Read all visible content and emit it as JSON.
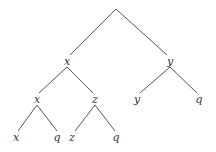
{
  "diagram": {
    "type": "tree",
    "nodes": [
      {
        "id": "root",
        "label": "",
        "x": 116,
        "y": 9
      },
      {
        "id": "n1",
        "label": "x",
        "x": 67,
        "y": 62
      },
      {
        "id": "n2",
        "label": "y",
        "x": 170,
        "y": 62
      },
      {
        "id": "n3",
        "label": "x",
        "x": 37,
        "y": 100
      },
      {
        "id": "n4",
        "label": "z",
        "x": 95,
        "y": 100
      },
      {
        "id": "n5",
        "label": "y",
        "x": 137,
        "y": 100
      },
      {
        "id": "n6",
        "label": "q",
        "x": 199,
        "y": 100
      },
      {
        "id": "n7",
        "label": "x",
        "x": 16,
        "y": 138
      },
      {
        "id": "n8",
        "label": "q",
        "x": 57,
        "y": 138
      },
      {
        "id": "n9",
        "label": "z",
        "x": 72,
        "y": 138
      },
      {
        "id": "n10",
        "label": "q",
        "x": 116,
        "y": 138
      }
    ],
    "edges": [
      [
        "root",
        "n1"
      ],
      [
        "root",
        "n2"
      ],
      [
        "n1",
        "n3"
      ],
      [
        "n1",
        "n4"
      ],
      [
        "n2",
        "n5"
      ],
      [
        "n2",
        "n6"
      ],
      [
        "n3",
        "n7"
      ],
      [
        "n3",
        "n8"
      ],
      [
        "n4",
        "n9"
      ],
      [
        "n4",
        "n10"
      ]
    ]
  }
}
